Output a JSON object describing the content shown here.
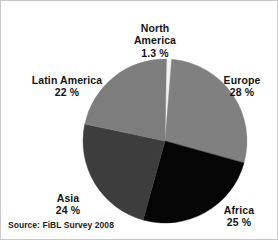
{
  "figure": {
    "background_color": "#ffffff",
    "border_color": "#c9c9c9",
    "source_caption": "Source: FiBL Survey 2008"
  },
  "chart_data": {
    "type": "pie",
    "title": "",
    "subtitle": "",
    "xlabel": "",
    "ylabel": "",
    "legend_position": "none",
    "grid": false,
    "value_unit": "%",
    "start_angle_deg": 0,
    "direction": "clockwise",
    "categories": [
      "North America",
      "Europe",
      "Africa",
      "Asia",
      "Latin America"
    ],
    "values": [
      1.3,
      28,
      25,
      24,
      22
    ],
    "value_labels": [
      "1.3 %",
      "28 %",
      "25 %",
      "24 %",
      "22 %"
    ],
    "colors": [
      "#f2f2f2",
      "#808080",
      "#050505",
      "#3d3d3d",
      "#7d7d7d"
    ],
    "slices": [
      {
        "name": "North America",
        "label_line1": "North",
        "label_line2": "America",
        "value": 1.3,
        "value_label": "1.3 %",
        "color": "#f2f2f2",
        "start_angle_deg": 0,
        "end_angle_deg": 4.68
      },
      {
        "name": "Europe",
        "label_line1": "Europe",
        "label_line2": "",
        "value": 28,
        "value_label": "28 %",
        "color": "#808080",
        "start_angle_deg": 4.68,
        "end_angle_deg": 105.48
      },
      {
        "name": "Africa",
        "label_line1": "Africa",
        "label_line2": "",
        "value": 25,
        "value_label": "25 %",
        "color": "#050505",
        "start_angle_deg": 105.48,
        "end_angle_deg": 195.48
      },
      {
        "name": "Asia",
        "label_line1": "Asia",
        "label_line2": "",
        "value": 24,
        "value_label": "24 %",
        "color": "#3d3d3d",
        "start_angle_deg": 195.48,
        "end_angle_deg": 281.88
      },
      {
        "name": "Latin America",
        "label_line1": "Latin America",
        "label_line2": "",
        "value": 22,
        "value_label": "22 %",
        "color": "#7d7d7d",
        "start_angle_deg": 281.88,
        "end_angle_deg": 361.0
      }
    ]
  },
  "labels": {
    "north_america": {
      "name": "North\nAmerica",
      "pct": "1.3 %"
    },
    "europe": {
      "name": "Europe",
      "pct": "28 %"
    },
    "africa": {
      "name": "Africa",
      "pct": "25 %"
    },
    "asia": {
      "name": "Asia",
      "pct": "24 %"
    },
    "latin_america": {
      "name": "Latin America",
      "pct": "22 %"
    }
  }
}
